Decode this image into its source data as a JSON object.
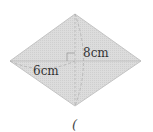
{
  "diagram": {
    "shape": "rhombus",
    "vertices": {
      "top": [
        75,
        14
      ],
      "right": [
        141,
        61
      ],
      "bottom": [
        75,
        106
      ],
      "left": [
        10,
        61
      ]
    },
    "fill_color": "#d9d9d9",
    "stroke_color": "#bdbdbd",
    "labels": {
      "vertical_half_diagonal": "8cm",
      "horizontal_half_diagonal": "6cm"
    },
    "right_angle_marker": true,
    "footer_glyph": "("
  }
}
